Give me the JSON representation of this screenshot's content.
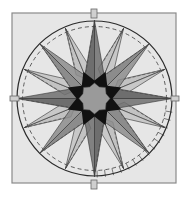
{
  "diagram": {
    "center": [
      94.5,
      98.5
    ],
    "block": {
      "x": 12,
      "y": 13,
      "w": 164,
      "h": 170,
      "fill": "#e6e6e6",
      "stroke": "#8a8a8a"
    },
    "outer_circle": {
      "r": 77.5,
      "stroke": "#2a2a2a"
    },
    "dashed_circle": {
      "r": 72,
      "stroke": "#3a3a3a",
      "dash": "4 3"
    },
    "cardinal_points": {
      "r_tip": 78,
      "r_base": 24,
      "half_angle": 11,
      "fill": "#6e6e6e",
      "angles": [
        0,
        90,
        180,
        270
      ]
    },
    "diagonal_points": {
      "r_tip": 77,
      "r_base": 24,
      "half_angle": 11,
      "fill": "#8c8c8c",
      "angles": [
        45,
        135,
        225,
        315
      ]
    },
    "minor_points": {
      "r_tip": 76,
      "r_base": 30,
      "half_angle": 7,
      "fill": "#c2c2c2",
      "angles": [
        22.5,
        67.5,
        112.5,
        157.5,
        202.5,
        247.5,
        292.5,
        337.5
      ]
    },
    "center_star": {
      "r_outer": 29,
      "r_inner": 18,
      "points": 8,
      "fill": "#111111"
    },
    "center_disc": {
      "r": 14,
      "fill": "#9a9a9a"
    },
    "tabs": [
      {
        "name": "tab-top",
        "x": 91,
        "y": 9,
        "w": 6,
        "h": 9
      },
      {
        "name": "tab-bottom",
        "x": 91,
        "y": 180,
        "w": 6,
        "h": 9
      },
      {
        "name": "tab-left",
        "x": 10,
        "y": 96,
        "w": 9,
        "h": 5
      },
      {
        "name": "tab-right",
        "x": 171,
        "y": 96,
        "w": 8,
        "h": 5
      }
    ],
    "tick_marks": {
      "from_angle": 100,
      "to_angle": 180,
      "step": 6,
      "r_in": 72,
      "r_out": 79,
      "stroke": "#777777"
    }
  }
}
